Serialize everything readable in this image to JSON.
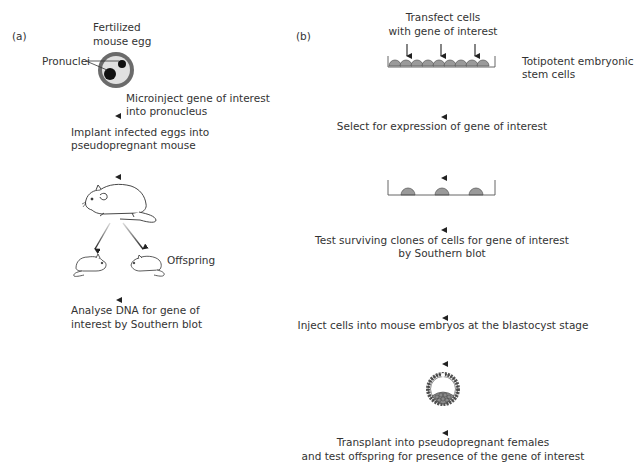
{
  "panel_a": {
    "label": "(a)",
    "egg_label_line1": "Fertilized",
    "egg_label_line2": "mouse egg",
    "pronuclei_label": "Pronuclei",
    "step1_line1": "Microinject gene of interest",
    "step1_line2": "into pronucleus",
    "step2_line1": "Implant infected eggs into",
    "step2_line2": "pseudopregnant mouse",
    "offspring_label": "Offspring",
    "step3_line1": "Analyse DNA for gene of",
    "step3_line2": "interest by Southern blot"
  },
  "panel_b": {
    "label": "(b)",
    "step1_line1": "Transfect cells",
    "step1_line2": "with gene of interest",
    "stem_cells_line1": "Totipotent  embryonic",
    "stem_cells_line2": "stem cells",
    "step2": "Select for expression of gene of interest",
    "step3_line1": "Test surviving clones of cells for gene of interest",
    "step3_line2": "by Southern blot",
    "step4": "Inject cells into mouse embryos at the blastocyst stage",
    "step5_line1": "Transplant into pseudopregnant females",
    "step5_line2": "and test offspring for presence of the gene of interest"
  },
  "colors": {
    "egg_ring": "#6b6b6b",
    "egg_inner": "#e0e0e0",
    "cell_fill": "#9a9a9a",
    "ink": "#222222"
  }
}
